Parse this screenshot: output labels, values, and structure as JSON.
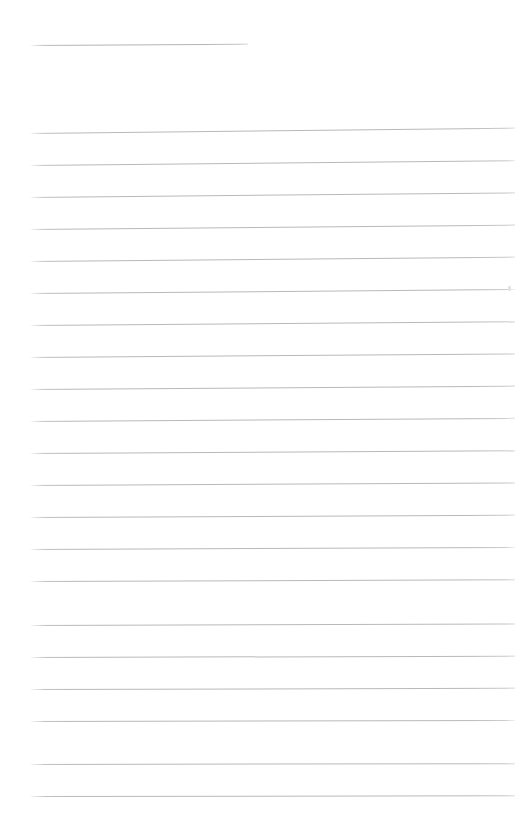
{
  "document": {
    "kind": "scanned-ruled-page",
    "page_width": 521,
    "page_height": 824,
    "background_color": "#ffffff",
    "rule_color": "#b9b9bc",
    "title_rule_color": "#b4b4b7",
    "visible_text": "",
    "note": "Blank scanned ruled sheet - no legible text content is rendered in the pixels"
  },
  "title_rule": {
    "name": "title-underline",
    "x": 31,
    "y": 45,
    "width": 217,
    "skew_deg": -0.35,
    "thickness": 1
  },
  "body_rules": {
    "left_x": 31,
    "right_x": 515,
    "width": 484,
    "first_y": 133,
    "spacing": 31.8,
    "count": 21,
    "thickness": 1,
    "lines": [
      {
        "index": 1,
        "y": 133,
        "skew_deg": -0.62
      },
      {
        "index": 2,
        "y": 165,
        "skew_deg": -0.58
      },
      {
        "index": 3,
        "y": 197,
        "skew_deg": -0.55
      },
      {
        "index": 4,
        "y": 229,
        "skew_deg": -0.52
      },
      {
        "index": 5,
        "y": 261,
        "skew_deg": -0.5
      },
      {
        "index": 6,
        "y": 293,
        "skew_deg": -0.47
      },
      {
        "index": 7,
        "y": 325,
        "skew_deg": -0.45
      },
      {
        "index": 8,
        "y": 357,
        "skew_deg": -0.42
      },
      {
        "index": 9,
        "y": 389,
        "skew_deg": -0.4
      },
      {
        "index": 10,
        "y": 421,
        "skew_deg": -0.37
      },
      {
        "index": 11,
        "y": 453,
        "skew_deg": -0.34
      },
      {
        "index": 12,
        "y": 485,
        "skew_deg": -0.31
      },
      {
        "index": 13,
        "y": 517,
        "skew_deg": -0.28
      },
      {
        "index": 14,
        "y": 549,
        "skew_deg": -0.25
      },
      {
        "index": 15,
        "y": 581,
        "skew_deg": -0.22
      },
      {
        "index": 16,
        "y": 625,
        "skew_deg": -0.19
      },
      {
        "index": 17,
        "y": 657,
        "skew_deg": -0.16
      },
      {
        "index": 18,
        "y": 689,
        "skew_deg": -0.14
      },
      {
        "index": 19,
        "y": 721,
        "skew_deg": -0.12
      },
      {
        "index": 20,
        "y": 764,
        "skew_deg": -0.1
      },
      {
        "index": 21,
        "y": 796,
        "skew_deg": -0.08
      }
    ]
  },
  "artifacts": [
    {
      "name": "scan-speck-right-margin",
      "x": 508,
      "y": 286,
      "width": 3,
      "height": 5
    }
  ]
}
